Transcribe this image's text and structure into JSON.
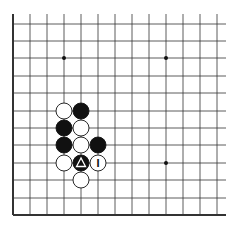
{
  "diagram": {
    "type": "go-board-fragment",
    "grid": {
      "x0": 13,
      "y_top": 14,
      "dx": 17,
      "x_right": 226,
      "rows_y": [
        24,
        41,
        58,
        76,
        93,
        111,
        128,
        145,
        163,
        180,
        198,
        215
      ],
      "cols": 13,
      "edges": [
        "left",
        "bottom"
      ]
    },
    "hoshi": [
      [
        3,
        2
      ],
      [
        9,
        2
      ],
      [
        9,
        8
      ]
    ],
    "stones": [
      {
        "col": 3,
        "row": 5,
        "color": "white"
      },
      {
        "col": 4,
        "row": 5,
        "color": "black"
      },
      {
        "col": 3,
        "row": 6,
        "color": "black"
      },
      {
        "col": 4,
        "row": 6,
        "color": "white"
      },
      {
        "col": 3,
        "row": 7,
        "color": "black"
      },
      {
        "col": 4,
        "row": 7,
        "color": "white"
      },
      {
        "col": 5,
        "row": 7,
        "color": "black"
      },
      {
        "col": 3,
        "row": 8,
        "color": "white"
      },
      {
        "col": 4,
        "row": 8,
        "color": "black",
        "mark": "triangle"
      },
      {
        "col": 5,
        "row": 8,
        "color": "white",
        "mark": "label",
        "label": "I"
      },
      {
        "col": 4,
        "row": 9,
        "color": "white"
      }
    ]
  }
}
